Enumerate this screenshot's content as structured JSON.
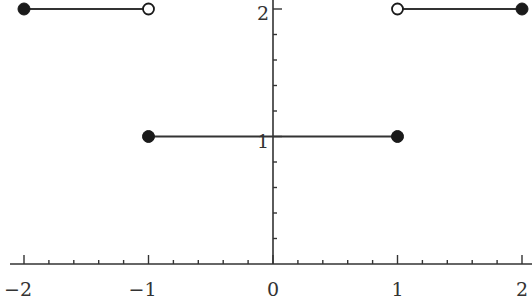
{
  "chart_data": {
    "type": "line",
    "title": "",
    "xlabel": "",
    "ylabel": "",
    "xlim": [
      -2,
      2
    ],
    "ylim": [
      0,
      2
    ],
    "grid": false,
    "legend": null,
    "x_ticks_major": [
      -2,
      -1,
      0,
      1,
      2
    ],
    "x_tick_labels": [
      "−2",
      "−1",
      "0",
      "1",
      "2"
    ],
    "x_minor_step": 0.2,
    "y_ticks_major": [
      1,
      2
    ],
    "y_tick_labels": [
      "1",
      "2"
    ],
    "y_minor_step": 0.2,
    "series": [
      {
        "name": "segment-left",
        "x": [
          -2,
          -1
        ],
        "y": [
          2,
          2
        ],
        "start_closed": true,
        "end_closed": false
      },
      {
        "name": "segment-middle",
        "x": [
          -1,
          1
        ],
        "y": [
          1,
          1
        ],
        "start_closed": true,
        "end_closed": true
      },
      {
        "name": "segment-right",
        "x": [
          1,
          2
        ],
        "y": [
          2,
          2
        ],
        "start_closed": false,
        "end_closed": true
      }
    ],
    "colors": {
      "line": "#333333",
      "axis": "#333333",
      "open_fill": "#ffffff"
    }
  }
}
